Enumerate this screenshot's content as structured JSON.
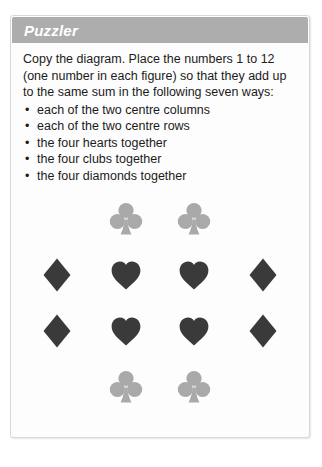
{
  "card": {
    "header": {
      "title": "Puzzler"
    },
    "intro": "Copy the diagram. Place the numbers 1 to 12 (one number in each figure) so that they add up to the same sum in the following seven ways:",
    "bullet_marker": "•",
    "bullets": [
      {
        "text": "each of the two centre columns"
      },
      {
        "text": "each of the two centre rows"
      },
      {
        "text": "the four hearts together"
      },
      {
        "text": "the four clubs together"
      },
      {
        "text": "the four diamonds together"
      }
    ],
    "diagram": {
      "rows": [
        {
          "cells": [
            {
              "suit": ""
            },
            {
              "suit": "club"
            },
            {
              "suit": "club"
            },
            {
              "suit": ""
            }
          ]
        },
        {
          "cells": [
            {
              "suit": "diamond"
            },
            {
              "suit": "heart"
            },
            {
              "suit": "heart"
            },
            {
              "suit": "diamond"
            }
          ]
        },
        {
          "cells": [
            {
              "suit": "diamond"
            },
            {
              "suit": "heart"
            },
            {
              "suit": "heart"
            },
            {
              "suit": "diamond"
            }
          ]
        },
        {
          "cells": [
            {
              "suit": ""
            },
            {
              "suit": "club"
            },
            {
              "suit": "club"
            },
            {
              "suit": ""
            }
          ]
        }
      ]
    }
  },
  "colors": {
    "header_bar": "#adadad",
    "header_text": "#ffffff",
    "card_background": "#fdfdfd",
    "card_border": "#d8d8d8",
    "body_text": "#1b1b1b",
    "club_fill": "#a9a9a9",
    "heart_fill": "#3a3a3a",
    "diamond_fill": "#3a3a3a"
  }
}
